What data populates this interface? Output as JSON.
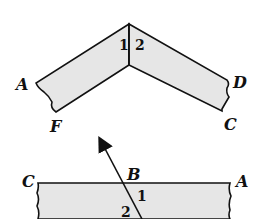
{
  "figure_top": {
    "labels": {
      "A": "A",
      "D": "D",
      "F": "F",
      "C": "C"
    },
    "angles": {
      "one": "1",
      "two": "2"
    },
    "fill_color": "#e6e6e6",
    "stroke_color": "#111111"
  },
  "figure_bottom": {
    "labels": {
      "C": "C",
      "B": "B",
      "A": "A"
    },
    "angles": {
      "one": "1",
      "two": "2"
    },
    "fill_color": "#e6e6e6",
    "stroke_color": "#111111"
  }
}
